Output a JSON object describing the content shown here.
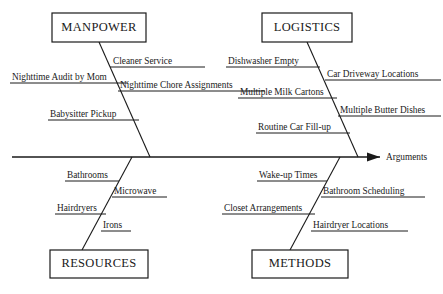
{
  "diagram": {
    "type": "fishbone-ishikawa",
    "title": "",
    "effect_label": "Arguments",
    "spine": {
      "y": 157,
      "x_start": 12,
      "x_end": 380,
      "arrow": true
    },
    "categories": [
      {
        "id": "manpower",
        "label": "MANPOWER",
        "position": "top-left",
        "box": {
          "x": 52,
          "y": 13,
          "w": 94,
          "h": 29
        },
        "bone": {
          "x1": 99,
          "y1": 42,
          "x2": 150,
          "y2": 157
        },
        "causes": [
          {
            "label": "Cleaner Service",
            "side": "right",
            "text_x": 113,
            "text_y": 64,
            "rule_x1": 110,
            "rule_x2": 205,
            "rule_y": 67
          },
          {
            "label": "Nighttime Audit by Mom",
            "side": "left",
            "text_x": 12,
            "text_y": 80,
            "rule_x1": 10,
            "rule_x2": 128,
            "rule_y": 83
          },
          {
            "label": "Nighttime Chore Assignments",
            "side": "right",
            "text_x": 120,
            "text_y": 88,
            "rule_x1": 118,
            "rule_x2": 265,
            "rule_y": 91
          },
          {
            "label": "Babysitter Pickup",
            "side": "left",
            "text_x": 50,
            "text_y": 117,
            "rule_x1": 48,
            "rule_x2": 139,
            "rule_y": 120
          }
        ]
      },
      {
        "id": "logistics",
        "label": "LOGISTICS",
        "position": "top-right",
        "box": {
          "x": 262,
          "y": 13,
          "w": 90,
          "h": 29
        },
        "bone": {
          "x1": 307,
          "y1": 42,
          "x2": 358,
          "y2": 157
        },
        "causes": [
          {
            "label": "Dishwasher Empty",
            "side": "left",
            "text_x": 228,
            "text_y": 64,
            "rule_x1": 226,
            "rule_x2": 320,
            "rule_y": 67
          },
          {
            "label": "Car Driveway Locations",
            "side": "right",
            "text_x": 327,
            "text_y": 77,
            "rule_x1": 325,
            "rule_x2": 441,
            "rule_y": 80
          },
          {
            "label": "Multiple Milk Cartons",
            "side": "left",
            "text_x": 240,
            "text_y": 95,
            "rule_x1": 238,
            "rule_x2": 337,
            "rule_y": 98
          },
          {
            "label": "Multiple Butter Dishes",
            "side": "right",
            "text_x": 340,
            "text_y": 113,
            "rule_x1": 338,
            "rule_x2": 441,
            "rule_y": 116
          },
          {
            "label": "Routine Car Fill-up",
            "side": "left",
            "text_x": 258,
            "text_y": 130,
            "rule_x1": 256,
            "rule_x2": 350,
            "rule_y": 133
          }
        ]
      },
      {
        "id": "resources",
        "label": "RESOURCES",
        "position": "bottom-left",
        "box": {
          "x": 50,
          "y": 250,
          "w": 98,
          "h": 28
        },
        "bone": {
          "x1": 132,
          "y1": 157,
          "x2": 82,
          "y2": 250
        },
        "causes": [
          {
            "label": "Bathrooms",
            "side": "left",
            "text_x": 67,
            "text_y": 178,
            "rule_x1": 65,
            "rule_x2": 119,
            "rule_y": 181
          },
          {
            "label": "Microwave",
            "side": "right",
            "text_x": 114,
            "text_y": 194,
            "rule_x1": 112,
            "rule_x2": 167,
            "rule_y": 197
          },
          {
            "label": "Hairdryers",
            "side": "left",
            "text_x": 57,
            "text_y": 211,
            "rule_x1": 55,
            "rule_x2": 106,
            "rule_y": 214
          },
          {
            "label": "Irons",
            "side": "right",
            "text_x": 103,
            "text_y": 228,
            "rule_x1": 101,
            "rule_x2": 131,
            "rule_y": 231
          }
        ]
      },
      {
        "id": "methods",
        "label": "METHODS",
        "position": "bottom-right",
        "box": {
          "x": 252,
          "y": 250,
          "w": 96,
          "h": 28
        },
        "bone": {
          "x1": 340,
          "y1": 157,
          "x2": 290,
          "y2": 250
        },
        "causes": [
          {
            "label": "Wake-up Times",
            "side": "left",
            "text_x": 259,
            "text_y": 178,
            "rule_x1": 257,
            "rule_x2": 327,
            "rule_y": 181
          },
          {
            "label": "Bathroom Scheduling",
            "side": "right",
            "text_x": 323,
            "text_y": 194,
            "rule_x1": 321,
            "rule_x2": 425,
            "rule_y": 197
          },
          {
            "label": "Closet Arrangements",
            "side": "left",
            "text_x": 224,
            "text_y": 211,
            "rule_x1": 222,
            "rule_x2": 315,
            "rule_y": 214
          },
          {
            "label": "Hairdryer Locations",
            "side": "right",
            "text_x": 313,
            "text_y": 228,
            "rule_x1": 311,
            "rule_x2": 408,
            "rule_y": 231
          }
        ]
      }
    ],
    "colors": {
      "line": "#1a1a1a",
      "background": "#ffffff",
      "text": "#1a1a1a"
    }
  }
}
